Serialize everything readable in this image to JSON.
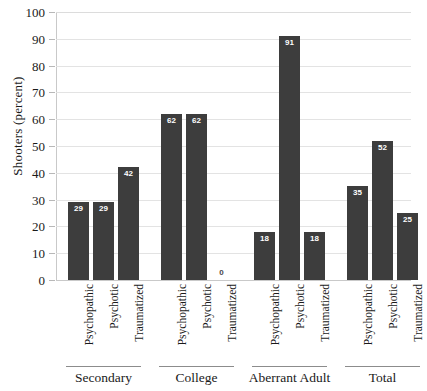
{
  "chart_data": {
    "type": "bar",
    "title": "",
    "subtitle": "",
    "xlabel": "",
    "ylabel": "Shooters (percent)",
    "ylim": [
      0,
      100
    ],
    "yticks": [
      0,
      10,
      20,
      30,
      40,
      50,
      60,
      70,
      80,
      90,
      100
    ],
    "ytick_labels": [
      "0",
      "10",
      "20",
      "30",
      "40",
      "50",
      "60",
      "70",
      "80",
      "90",
      "100"
    ],
    "grid": "horizontal",
    "legend": "none",
    "bar_color": "#3d3d3d",
    "gridline_color": "#e3e3e3",
    "axis_color": "#c9c9c9",
    "categories": [
      "Psychopathic",
      "Psychotic",
      "Traumatized"
    ],
    "groups": [
      {
        "label": "Secondary",
        "bars": [
          {
            "category": "Psychopathic",
            "value": 29,
            "label": "29"
          },
          {
            "category": "Psychotic",
            "value": 29,
            "label": "29"
          },
          {
            "category": "Traumatized",
            "value": 42,
            "label": "42"
          }
        ]
      },
      {
        "label": "College",
        "bars": [
          {
            "category": "Psychopathic",
            "value": 62,
            "label": "62"
          },
          {
            "category": "Psychotic",
            "value": 62,
            "label": "62"
          },
          {
            "category": "Traumatized",
            "value": 0,
            "label": "0"
          }
        ]
      },
      {
        "label": "Aberrant Adult",
        "bars": [
          {
            "category": "Psychopathic",
            "value": 18,
            "label": "18"
          },
          {
            "category": "Psychotic",
            "value": 91,
            "label": "91"
          },
          {
            "category": "Traumatized",
            "value": 18,
            "label": "18"
          }
        ]
      },
      {
        "label": "Total",
        "bars": [
          {
            "category": "Psychopathic",
            "value": 35,
            "label": "35"
          },
          {
            "category": "Psychotic",
            "value": 52,
            "label": "52"
          },
          {
            "category": "Traumatized",
            "value": 25,
            "label": "25"
          }
        ]
      }
    ]
  }
}
